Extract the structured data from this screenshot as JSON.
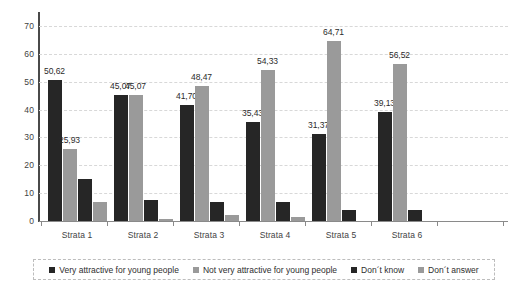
{
  "chart_data": {
    "type": "bar",
    "title": "",
    "subtitle": "",
    "xlabel": "",
    "ylabel": "",
    "ylim": [
      0,
      75
    ],
    "yticks": [
      0,
      10,
      20,
      30,
      40,
      50,
      60,
      70
    ],
    "ytick_labels": [
      "0",
      "10",
      "20",
      "30",
      "40",
      "50",
      "60",
      "70"
    ],
    "grid": true,
    "legend_position": "bottom",
    "decimal_separator": ",",
    "categories": [
      "Strata 1",
      "Strata 2",
      "Strata 3",
      "Strata 4",
      "Strata 5",
      "Strata 6"
    ],
    "series": [
      {
        "name": "Very attractive for young people",
        "color": "#262626",
        "values": [
          50.62,
          45.07,
          41.7,
          35.43,
          31.37,
          39.13
        ],
        "labels": [
          "50,62",
          "45,07",
          "41,70",
          "35,43",
          "31,37",
          "39,13"
        ]
      },
      {
        "name": "Not very attractive for young people",
        "color": "#9a9a9a",
        "values": [
          25.93,
          45.07,
          48.47,
          54.33,
          64.71,
          56.52
        ],
        "labels": [
          "25,93",
          "45,07",
          "48,47",
          "54,33",
          "64,71",
          "56,52"
        ]
      },
      {
        "name": "Don´t know",
        "color": "#262626",
        "values": [
          15.0,
          7.5,
          7.0,
          7.0,
          4.0,
          4.0
        ],
        "labels": [
          "",
          "",
          "",
          "",
          "",
          ""
        ]
      },
      {
        "name": "Don´t answer",
        "color": "#9a9a9a",
        "values": [
          7.0,
          0.7,
          2.0,
          1.3,
          0.0,
          0.0
        ],
        "labels": [
          "",
          "",
          "",
          "",
          "",
          ""
        ]
      }
    ]
  },
  "legend": {
    "items": [
      {
        "label": "Very attractive for young people",
        "swatch": "dark"
      },
      {
        "label": "Not very attractive for young people",
        "swatch": "light"
      },
      {
        "label": "Don´t know",
        "swatch": "dark"
      },
      {
        "label": "Don´t answer",
        "swatch": "light"
      }
    ]
  }
}
